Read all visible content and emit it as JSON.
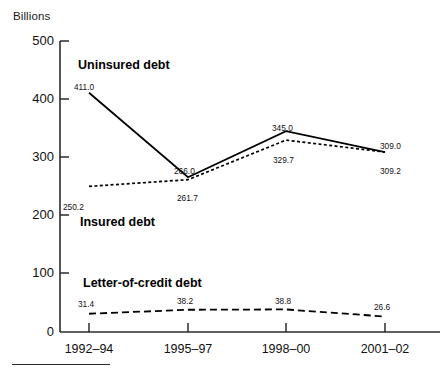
{
  "chart_data": {
    "type": "line",
    "title": "",
    "ylabel": "Billions",
    "xlabel": "",
    "categories": [
      "1992–94",
      "1995–97",
      "1998–00",
      "2001–02"
    ],
    "ylim": [
      0,
      500
    ],
    "yticks": [
      "0",
      "100",
      "200",
      "300",
      "400",
      "500"
    ],
    "grid": false,
    "legend": "inline-labels",
    "series": [
      {
        "name": "Uninsured debt",
        "style": "solid",
        "values": [
          411.0,
          266.0,
          345.0,
          309.0
        ],
        "labels": [
          "411.0",
          "266.0",
          "345.0",
          "309.0"
        ]
      },
      {
        "name": "Insured debt",
        "style": "dotted",
        "values": [
          250.2,
          261.7,
          329.7,
          309.2
        ],
        "labels": [
          "250.2",
          "261.7",
          "329.7",
          "309.2"
        ]
      },
      {
        "name": "Letter-of-credit debt",
        "style": "dashed",
        "values": [
          31.4,
          38.2,
          38.8,
          26.6
        ],
        "labels": [
          "31.4",
          "38.2",
          "38.8",
          "26.6"
        ]
      }
    ]
  },
  "axis": {
    "y_title": "Billions",
    "y_ticks": {
      "t500": "500",
      "t400": "400",
      "t300": "300",
      "t200": "200",
      "t100": "100",
      "t0": "0"
    },
    "x_ticks": {
      "x1": "1992–94",
      "x2": "1995–97",
      "x3": "1998–00",
      "x4": "2001–02"
    }
  },
  "series_labels": {
    "uninsured": "Uninsured debt",
    "insured": "Insured debt",
    "letter_of_credit": "Letter-of-credit debt"
  },
  "point_labels": {
    "uninsured_1": "411.0",
    "uninsured_2": "266.0",
    "uninsured_3": "345.0",
    "uninsured_4": "309.0",
    "insured_1": "250.2",
    "insured_2": "261.7",
    "insured_3": "329.7",
    "insured_4": "309.2",
    "loc_1": "31.4",
    "loc_2": "38.2",
    "loc_3": "38.8",
    "loc_4": "26.6"
  },
  "colors": {
    "ink": "#000000",
    "axis": "#2b2b2b",
    "background": "#ffffff"
  }
}
